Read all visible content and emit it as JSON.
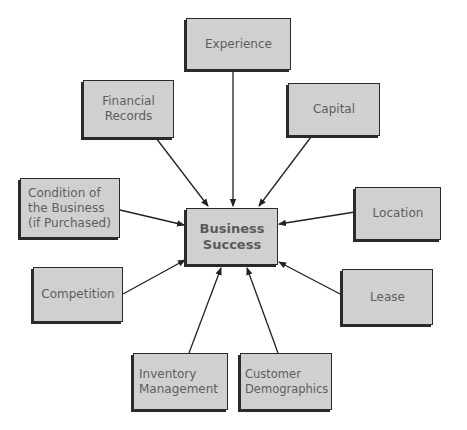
{
  "diagram": {
    "center": {
      "label": "Business\nSuccess"
    },
    "nodes": [
      {
        "id": "experience",
        "label": "Experience"
      },
      {
        "id": "financial-records",
        "label": "Financial\nRecords"
      },
      {
        "id": "capital",
        "label": "Capital"
      },
      {
        "id": "condition",
        "label": "Condition of\nthe Business\n(if Purchased)"
      },
      {
        "id": "location",
        "label": "Location"
      },
      {
        "id": "competition",
        "label": "Competition"
      },
      {
        "id": "lease",
        "label": "Lease"
      },
      {
        "id": "inventory",
        "label": "Inventory\nManagement"
      },
      {
        "id": "customer",
        "label": "Customer\nDemographics"
      }
    ],
    "edges": [
      {
        "from": "experience",
        "to": "center"
      },
      {
        "from": "financial-records",
        "to": "center"
      },
      {
        "from": "capital",
        "to": "center"
      },
      {
        "from": "condition",
        "to": "center"
      },
      {
        "from": "location",
        "to": "center"
      },
      {
        "from": "competition",
        "to": "center"
      },
      {
        "from": "lease",
        "to": "center"
      },
      {
        "from": "inventory",
        "to": "center"
      },
      {
        "from": "customer",
        "to": "center"
      }
    ],
    "colors": {
      "box_fill": "#d0d0d0",
      "box_border": "#2a2a2a",
      "text": "#5e5e5e",
      "arrow": "#222222"
    }
  }
}
